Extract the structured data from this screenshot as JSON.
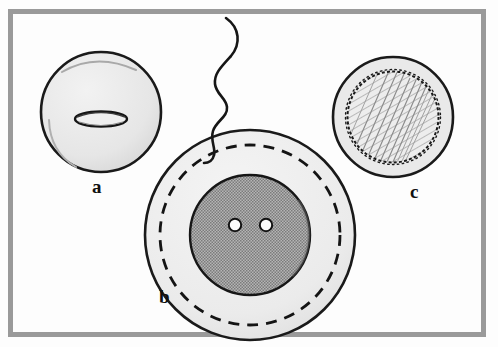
{
  "figure": {
    "kind": "scientific-line-illustration",
    "caption_visible": false,
    "frame": {
      "border_color": "#9a9a9a",
      "background_color": "#fdfdfd"
    },
    "panels": [
      {
        "id": "a",
        "label": "a",
        "name": "unfertilized-egg",
        "description": "Light gray sphere with a small flattened ellipse (slit) at its center",
        "center": {
          "x": 101,
          "y": 112
        },
        "radius": 60,
        "fill_color": "#e6e6e6",
        "stroke_color": "#1a1a1a",
        "features": [
          {
            "name": "central-slit",
            "shape": "ellipse",
            "center": {
              "x": 101,
              "y": 119
            },
            "rx": 26,
            "ry": 7,
            "fill_color": "#efefef",
            "stroke_color": "#151515"
          }
        ]
      },
      {
        "id": "b",
        "label": "b",
        "name": "fertilized-egg-with-pronuclei",
        "description": "Large pale sphere with dashed inner membrane ring, a dark stippled inner sphere containing two small white pronuclei, and a wavy sperm tail entering from above",
        "center": {
          "x": 250,
          "y": 235
        },
        "radius": 105,
        "fill_color": "#ececec",
        "stroke_color": "#1a1a1a",
        "features": [
          {
            "name": "dashed-membrane-ring",
            "shape": "dashed-circle",
            "radius": 91,
            "stroke_color": "#141414",
            "dash": "11 8"
          },
          {
            "name": "inner-stippled-sphere",
            "shape": "circle",
            "radius": 60,
            "fill_color": "#9c9c9c",
            "stroke_color": "#161616"
          },
          {
            "name": "pronucleus-left",
            "shape": "circle",
            "center": {
              "x": 235,
              "y": 225
            },
            "radius": 6,
            "fill_color": "#fbfbfb",
            "stroke_color": "#121212"
          },
          {
            "name": "pronucleus-right",
            "shape": "circle",
            "center": {
              "x": 266,
              "y": 225
            },
            "radius": 6,
            "fill_color": "#fbfbfb",
            "stroke_color": "#121212"
          },
          {
            "name": "sperm-tail",
            "shape": "wavy-line",
            "stroke_color": "#161616",
            "stroke_width": 2.6
          }
        ]
      },
      {
        "id": "c",
        "label": "c",
        "name": "cleaving-egg-hatched-core",
        "description": "Sphere with an outer pale ring and a scalloped-edge inner circle filled with diagonal hatching",
        "center": {
          "x": 393,
          "y": 117
        },
        "radius": 60,
        "fill_color": "#e7e7e7",
        "stroke_color": "#1a1a1a",
        "features": [
          {
            "name": "scalloped-inner-circle",
            "shape": "scalloped-circle",
            "radius": 46,
            "fill_color": "#ededed",
            "stroke_color": "#1a1a1a",
            "bumps": 46
          },
          {
            "name": "diagonal-hatching",
            "shape": "hatch-lines",
            "angle_degrees": 60,
            "stroke_color": "#7d7d7d",
            "spacing": 5
          }
        ]
      }
    ],
    "labels": {
      "a": "a",
      "b": "b",
      "c": "c"
    },
    "colors": {
      "ink": "#141414",
      "pale_fill": "#e8e8e8",
      "mid_fill": "#9c9c9c",
      "frame": "#9a9a9a",
      "paper": "#fdfdfd"
    }
  }
}
